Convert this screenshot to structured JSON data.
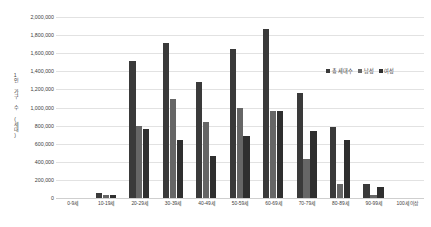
{
  "chart_data": {
    "type": "bar",
    "title": "",
    "xlabel": "",
    "ylabel": "1인 가구 수 (세대)",
    "ylim": [
      0,
      2000000
    ],
    "grid": true,
    "legend_position": "right-inside",
    "categories": [
      "0-9세",
      "10-19세",
      "20-29세",
      "30-39세",
      "40-49세",
      "50-59세",
      "60-69세",
      "70-79세",
      "80-89세",
      "90-99세",
      "100세 이상"
    ],
    "ytick_labels": [
      "2,000,000",
      "1,800,000",
      "1,600,000",
      "1,400,000",
      "1,200,000",
      "1,000,000",
      "800,000",
      "600,000",
      "400,000",
      "200,000",
      "0"
    ],
    "ytick_values": [
      2000000,
      1800000,
      1600000,
      1400000,
      1200000,
      1000000,
      800000,
      600000,
      400000,
      200000,
      0
    ],
    "series": [
      {
        "name": "총 세대수",
        "color": "#3a3a3a",
        "values": [
          0,
          60000,
          1510000,
          1710000,
          1280000,
          1650000,
          1870000,
          1160000,
          790000,
          150000,
          4000
        ]
      },
      {
        "name": "남성",
        "color": "#666666",
        "values": [
          0,
          32000,
          800000,
          1090000,
          840000,
          1000000,
          960000,
          430000,
          150000,
          30000,
          1000
        ]
      },
      {
        "name": "여성",
        "color": "#2f2f2f",
        "values": [
          0,
          28000,
          760000,
          640000,
          460000,
          680000,
          960000,
          740000,
          640000,
          120000,
          3000
        ]
      }
    ]
  },
  "legend": {
    "items": [
      {
        "label": "총 세대수"
      },
      {
        "label": "남성"
      },
      {
        "label": "여성"
      }
    ]
  }
}
